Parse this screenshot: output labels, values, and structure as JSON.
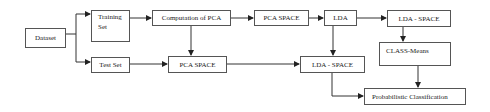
{
  "diagram": {
    "nodes": {
      "dataset": "Dataset",
      "training_set_line1": "Training",
      "training_set_line2": "Set",
      "test_set": "Test Set",
      "computation_pca": "Computation of PCA",
      "pca_space_bottom": "PCA SPACE",
      "pca_space_top": "PCA SPACE",
      "lda": "LDA",
      "lda_space_top": "LDA - SPACE",
      "class_means": "CLASS-Means",
      "lda_space_middle": "LDA - SPACE",
      "probabilistic_classification": "Probabilistic Classification"
    },
    "edges": [
      {
        "from": "Dataset",
        "to": "Training Set"
      },
      {
        "from": "Dataset",
        "to": "Test Set"
      },
      {
        "from": "Training Set",
        "to": "Computation of PCA"
      },
      {
        "from": "Computation of PCA",
        "to": "PCA SPACE (top)"
      },
      {
        "from": "Computation of PCA",
        "to": "PCA SPACE (bottom)"
      },
      {
        "from": "Test Set",
        "to": "PCA SPACE (bottom)"
      },
      {
        "from": "PCA SPACE (top)",
        "to": "LDA"
      },
      {
        "from": "LDA",
        "to": "LDA - SPACE (top)"
      },
      {
        "from": "LDA",
        "to": "LDA - SPACE (middle)"
      },
      {
        "from": "PCA SPACE (bottom)",
        "to": "LDA - SPACE (middle)"
      },
      {
        "from": "LDA - SPACE (top)",
        "to": "CLASS-Means"
      },
      {
        "from": "CLASS-Means",
        "to": "Probabilistic Classification"
      },
      {
        "from": "LDA - SPACE (middle)",
        "to": "Probabilistic Classification"
      }
    ],
    "colors": {
      "line": "#333333",
      "box_border": "#555555",
      "text": "#222222",
      "background": "#ffffff"
    }
  }
}
